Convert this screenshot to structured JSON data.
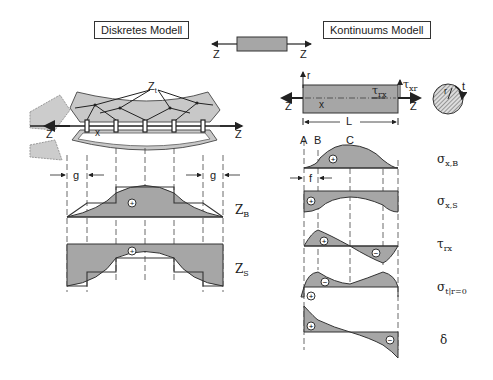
{
  "titles": {
    "discrete": "Diskretes Modell",
    "continuum": "Kontinuums Modell"
  },
  "center_bar": {
    "left_force": "Z",
    "right_force": "Z"
  },
  "discrete_model": {
    "force_left": "Z",
    "force_right": "Z",
    "coord": "x",
    "inner_forces": "Zt",
    "dim_left": "g",
    "dim_right": "g",
    "curve_labels": {
      "bond": "Z",
      "bond_sub": "B",
      "steel": "Z",
      "steel_sub": "S"
    },
    "signs": {
      "bond": "+",
      "steel": "+"
    }
  },
  "continuum_model": {
    "axis_r": "r",
    "coord": "x",
    "force_left": "Z",
    "force_right": "Z",
    "tau_rx": "τ",
    "tau_rx_sub": "rx",
    "tau_xr": "τ",
    "tau_xr_sub": "xr",
    "length": "L",
    "cross_section": {
      "r": "r",
      "t": "t"
    },
    "points": [
      "A",
      "B",
      "C"
    ],
    "dim_f": "f"
  },
  "diagrams": [
    {
      "symbol": "σ",
      "sub": "x,B",
      "signs": [
        "+"
      ]
    },
    {
      "symbol": "σ",
      "sub": "x,S",
      "signs": [
        "+"
      ]
    },
    {
      "symbol": "τ",
      "sub": "rx",
      "signs": [
        "+",
        "−"
      ]
    },
    {
      "symbol": "σ",
      "sub": "t",
      "tail": "|r=0",
      "signs": [
        "−",
        "+"
      ]
    },
    {
      "symbol": "δ",
      "sub": "",
      "signs": [
        "+",
        "−"
      ]
    }
  ],
  "colors": {
    "fill": "#a6a6a6",
    "line": "#333333",
    "hatch": "#777777"
  }
}
